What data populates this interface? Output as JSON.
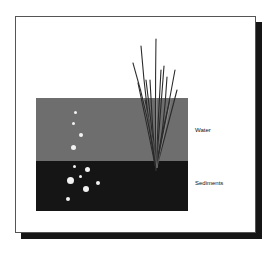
{
  "diagram": {
    "labels": {
      "water": "Water",
      "sediments": "Sediments"
    },
    "colors": {
      "background": "#ffffff",
      "frame_border": "#555555",
      "shadow": "#161616",
      "water": "#6e6e6e",
      "sediments": "#151515",
      "bubbles": "#f2f2f2",
      "plant": "#2a2a2a"
    },
    "elements": {
      "plant": "emergent-grass-plant",
      "bubbles_in_water": 4,
      "bubbles_in_sediment": 7
    }
  }
}
